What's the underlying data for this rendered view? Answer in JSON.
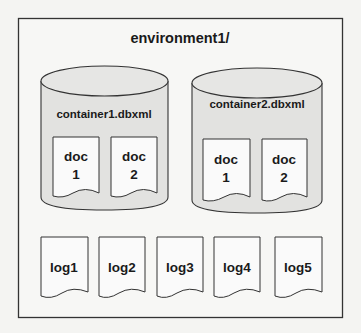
{
  "colors": {
    "background": "#f4f4f2",
    "frame_stroke": "#333333",
    "cylinder_fill": "#e2e2e0",
    "doc_fill": "#fafafa",
    "text": "#1a1a1a"
  },
  "environment": {
    "title": "environment1/"
  },
  "containers": [
    {
      "name": "container1.dbxml",
      "documents": [
        {
          "line1": "doc",
          "line2": "1"
        },
        {
          "line1": "doc",
          "line2": "2"
        }
      ]
    },
    {
      "name": "container2.dbxml",
      "documents": [
        {
          "line1": "doc",
          "line2": "1"
        },
        {
          "line1": "doc",
          "line2": "2"
        }
      ]
    }
  ],
  "logs": [
    {
      "label": "log1"
    },
    {
      "label": "log2"
    },
    {
      "label": "log3"
    },
    {
      "label": "log4"
    },
    {
      "label": "log5"
    }
  ]
}
